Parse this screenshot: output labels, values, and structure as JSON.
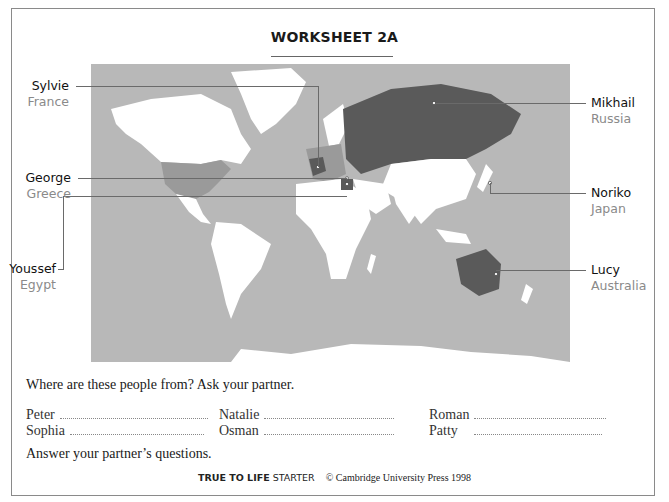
{
  "worksheet": {
    "title": "WORKSHEET 2A"
  },
  "map": {
    "colors": {
      "ocean": "#b8b8b8",
      "land": "#ffffff",
      "highlight_dark": "#5a5a5a",
      "highlight_mid": "#9a9a9a"
    },
    "people": [
      {
        "name": "Sylvie",
        "country": "France",
        "side": "left"
      },
      {
        "name": "George",
        "country": "Greece",
        "side": "left"
      },
      {
        "name": "Youssef",
        "country": "Egypt",
        "side": "left"
      },
      {
        "name": "Mikhail",
        "country": "Russia",
        "side": "right"
      },
      {
        "name": "Noriko",
        "country": "Japan",
        "side": "right"
      },
      {
        "name": "Lucy",
        "country": "Australia",
        "side": "right"
      }
    ]
  },
  "exercise": {
    "instruction": "Where are these people from? Ask your partner.",
    "names": [
      [
        "Peter",
        "Natalie",
        "Roman"
      ],
      [
        "Sophia",
        "Osman",
        "Patty"
      ]
    ],
    "closing": "Answer your partner’s questions."
  },
  "footer": {
    "brand_bold": "TRUE TO LIFE",
    "brand_light": "STARTER",
    "copyright": "© Cambridge University Press 1998"
  }
}
